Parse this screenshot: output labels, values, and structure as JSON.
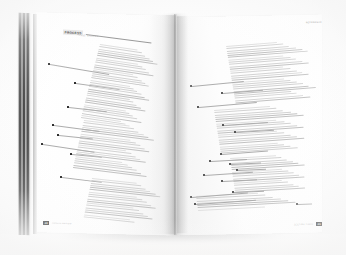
{
  "scene": {
    "subject": "open-book-spread",
    "description": "Photograph of an open magazine or book spread lying flat, shot slightly from above at an angle, showing two facing pages of annotated body text.",
    "background_color": "#fcfcfc",
    "surface_color": "#f5f4f3"
  },
  "book": {
    "page_block": {
      "name": "page-edge-block",
      "position": "left",
      "description": "Stacked cut page edges with dark printed bands visible along the fore-edge",
      "band_colors": [
        "#2c2c2c",
        "#161616",
        "#1e1e1e",
        "#0f0f0f",
        "#3b3b3b",
        "#1a1a1a"
      ]
    },
    "gutter": {
      "name": "center-gutter",
      "description": "Central fold with soft shadow where the two pages meet"
    }
  },
  "left_page": {
    "running_head": "CASE STUDIES",
    "headline": "PROCESS",
    "folio": "48",
    "folio_caption": "ANNUAL REVIEW",
    "annotations": [
      {
        "id": "L1",
        "marker": "square",
        "x": 48,
        "y": 63,
        "leader_length": 60,
        "leader_angle": 9.5
      },
      {
        "id": "L2",
        "marker": "square",
        "x": 74,
        "y": 82,
        "leader_length": 44,
        "leader_angle": 8.0
      },
      {
        "id": "L3",
        "marker": "square",
        "x": 67,
        "y": 106,
        "leader_length": 38,
        "leader_angle": 6.5
      },
      {
        "id": "L4",
        "marker": "square",
        "x": 52,
        "y": 124,
        "leader_length": 46,
        "leader_angle": 7.5
      },
      {
        "id": "L5",
        "marker": "square",
        "x": 57,
        "y": 134,
        "leader_length": 34,
        "leader_angle": 6.0
      },
      {
        "id": "L6",
        "marker": "square",
        "x": 41,
        "y": 143,
        "leader_length": 52,
        "leader_angle": 8.5
      },
      {
        "id": "L7",
        "marker": "square",
        "x": 70,
        "y": 153,
        "leader_length": 30,
        "leader_angle": 5.5
      },
      {
        "id": "L8",
        "marker": "square",
        "x": 60,
        "y": 176,
        "leader_length": 40,
        "leader_angle": 7.0
      }
    ],
    "text_columns": [
      {
        "id": "LC1",
        "x": 100,
        "y": 44,
        "width": 62,
        "lines": 34,
        "skew": 8.5
      },
      {
        "id": "LC2",
        "x": 84,
        "y": 120,
        "width": 74,
        "lines": 22,
        "skew": 7.0
      },
      {
        "id": "LC3",
        "x": 92,
        "y": 178,
        "width": 72,
        "lines": 18,
        "skew": 6.0
      }
    ]
  },
  "right_page": {
    "running_head": "REFERENCE",
    "folio": "49",
    "folio_caption": "SECTION THREE",
    "annotations": [
      {
        "id": "R1",
        "marker": "round",
        "x": 190,
        "y": 85,
        "leader_length": 52,
        "leader_angle": -5.5
      },
      {
        "id": "R2",
        "marker": "round",
        "x": 221,
        "y": 92,
        "leader_length": 40,
        "leader_angle": -4.5
      },
      {
        "id": "R3",
        "marker": "round",
        "x": 197,
        "y": 106,
        "leader_length": 58,
        "leader_angle": -5.0
      },
      {
        "id": "R4",
        "marker": "round",
        "x": 222,
        "y": 124,
        "leader_length": 44,
        "leader_angle": -4.0
      },
      {
        "id": "R5",
        "marker": "round",
        "x": 234,
        "y": 131,
        "leader_length": 38,
        "leader_angle": -3.5
      },
      {
        "id": "R6",
        "marker": "round",
        "x": 220,
        "y": 153,
        "leader_length": 46,
        "leader_angle": -4.5
      },
      {
        "id": "R7",
        "marker": "round",
        "x": 209,
        "y": 160,
        "leader_length": 36,
        "leader_angle": -3.0
      },
      {
        "id": "R8",
        "marker": "round",
        "x": 229,
        "y": 163,
        "leader_length": 30,
        "leader_angle": -3.0
      },
      {
        "id": "R9",
        "marker": "round",
        "x": 236,
        "y": 169,
        "leader_length": 28,
        "leader_angle": -2.5
      },
      {
        "id": "R10",
        "marker": "round",
        "x": 203,
        "y": 174,
        "leader_length": 48,
        "leader_angle": -4.0
      },
      {
        "id": "R11",
        "marker": "round",
        "x": 221,
        "y": 180,
        "leader_length": 34,
        "leader_angle": -3.0
      },
      {
        "id": "R12",
        "marker": "round",
        "x": 232,
        "y": 191,
        "leader_length": 30,
        "leader_angle": -2.5
      },
      {
        "id": "R13",
        "marker": "round",
        "x": 190,
        "y": 196,
        "leader_length": 56,
        "leader_angle": -4.5
      },
      {
        "id": "R14",
        "marker": "round",
        "x": 194,
        "y": 203,
        "leader_length": 60,
        "leader_angle": -4.0
      },
      {
        "id": "R15",
        "marker": "round",
        "x": 296,
        "y": 203,
        "leader_length": 14,
        "leader_angle": -2.0
      }
    ],
    "text_columns": [
      {
        "id": "RC1",
        "x": 226,
        "y": 46,
        "width": 82,
        "lines": 26,
        "skew": -4.5
      },
      {
        "id": "RC2",
        "x": 214,
        "y": 110,
        "width": 90,
        "lines": 20,
        "skew": -4.0
      },
      {
        "id": "RC3",
        "x": 230,
        "y": 158,
        "width": 74,
        "lines": 16,
        "skew": -3.5
      },
      {
        "id": "RC4",
        "x": 196,
        "y": 196,
        "width": 100,
        "lines": 7,
        "skew": -3.0
      }
    ]
  },
  "colors": {
    "paper": "#ffffff",
    "body_text": "#d3d3d3",
    "body_text_dark": "#c2c2c2",
    "marker": "#2a2a2a",
    "leader_line": "#adadad",
    "folio_background": "#2d2d2d",
    "folio_text": "#ffffff",
    "running_head": "#8d8d8d"
  }
}
